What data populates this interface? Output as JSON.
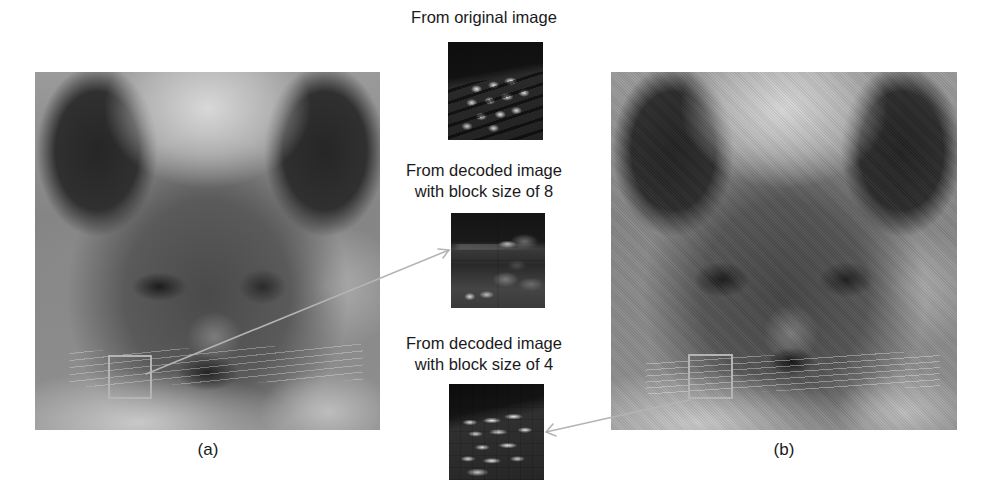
{
  "figure": {
    "panels": [
      {
        "id": "a",
        "caption": "(a)",
        "description": "original-cat-image"
      },
      {
        "id": "b",
        "caption": "(b)",
        "description": "decoded-cat-image"
      }
    ],
    "patches": [
      {
        "caption_lines": [
          "From original image"
        ]
      },
      {
        "caption_lines": [
          "From decoded image",
          "with block size of 8"
        ]
      },
      {
        "caption_lines": [
          "From decoded image",
          "with block size of 4"
        ]
      }
    ],
    "colors": {
      "roi_box": "#b4b4b4",
      "arrow": "#b4b4b4",
      "background": "#ffffff"
    }
  }
}
